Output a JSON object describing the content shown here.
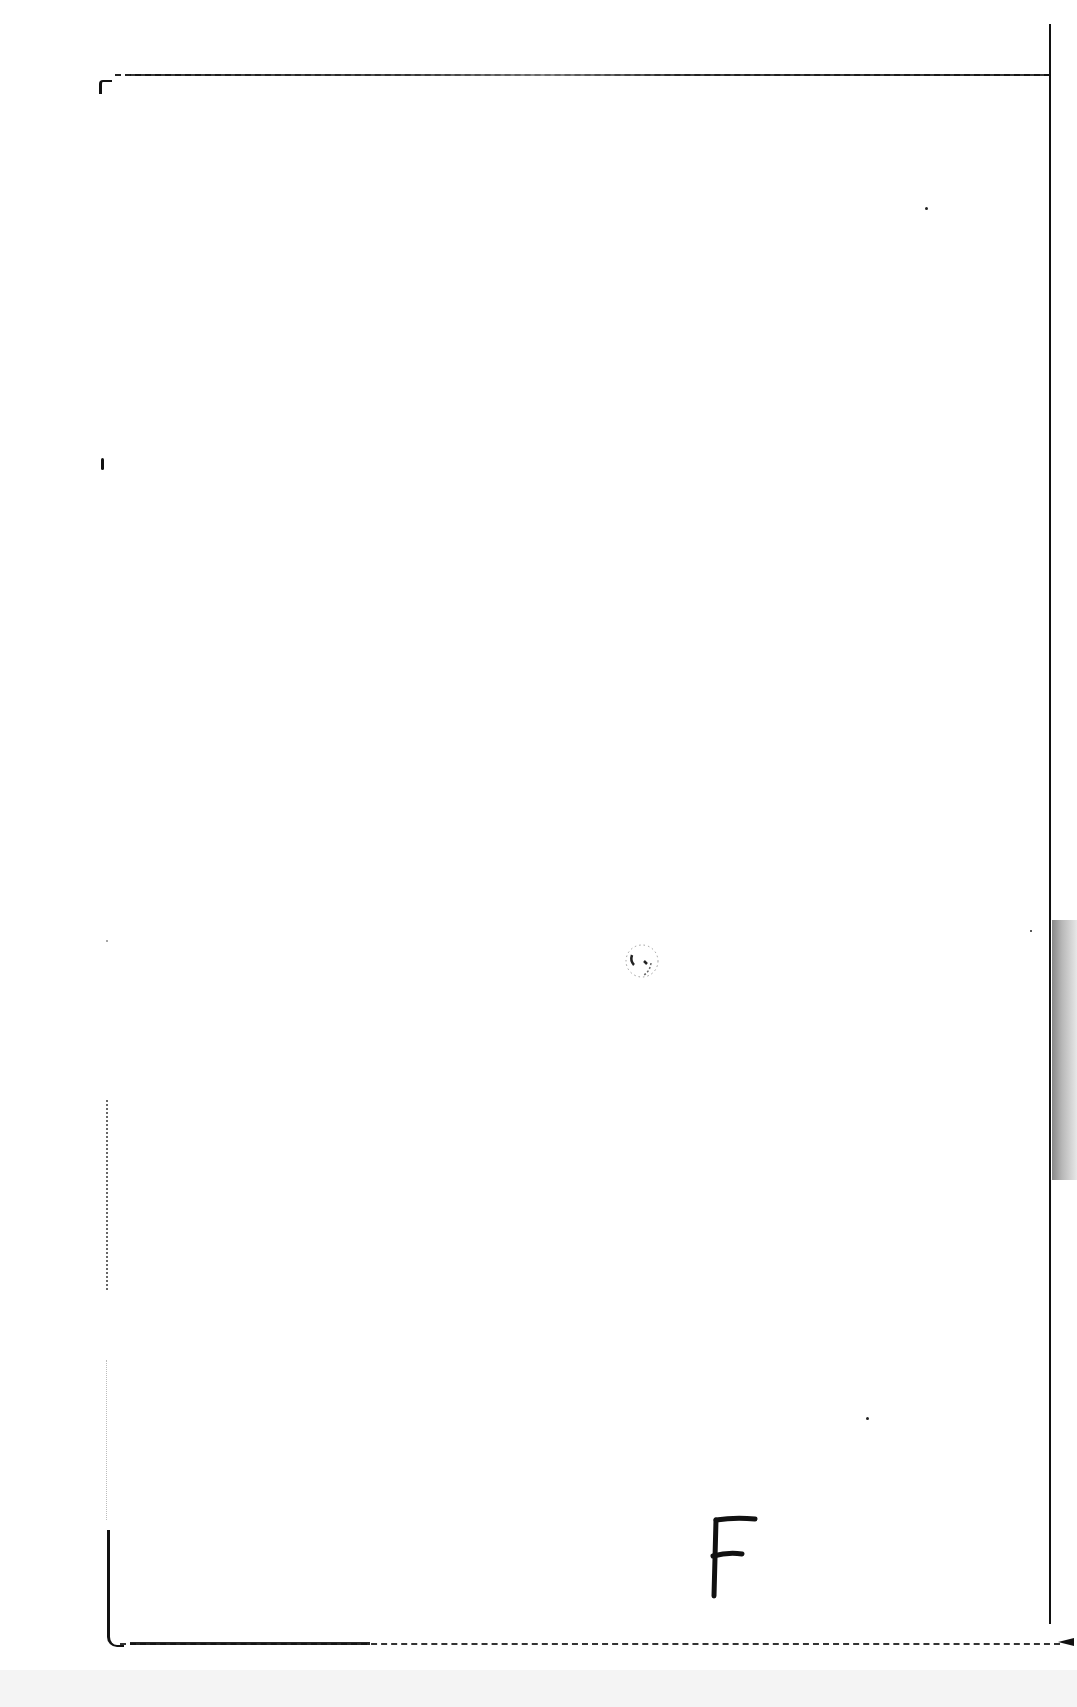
{
  "document": {
    "type": "scanned blank page with hand-drawn border",
    "handwritten_mark": {
      "text": "F",
      "position": "bottom-right inside frame"
    },
    "center_mark": {
      "description": "faint circular smudge"
    },
    "colors": {
      "paper": "#ffffff",
      "ink": "#111111",
      "scan_edge": "#f4f4f4"
    }
  }
}
